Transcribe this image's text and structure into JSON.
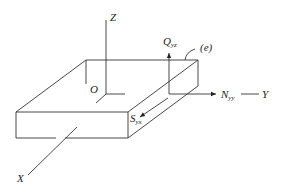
{
  "diagram": {
    "title": "",
    "colors": {
      "line": "#333333",
      "background": "#ffffff"
    },
    "labels": {
      "z_axis": "Z",
      "y_axis": "Y",
      "x_axis": "X",
      "origin": "O",
      "edge": "(e)",
      "q": {
        "main": "Q",
        "sub": "yz"
      },
      "n": {
        "main": "N",
        "sub": "yy"
      },
      "s": {
        "main": "S",
        "sub": "yx"
      }
    },
    "elements": [
      "plate-box",
      "z-axis",
      "x-axis",
      "y-axis",
      "shear-force-arrow-Qyz",
      "normal-force-arrow-Nyy",
      "shear-force-arrow-Syx",
      "edge-leader-e"
    ]
  }
}
